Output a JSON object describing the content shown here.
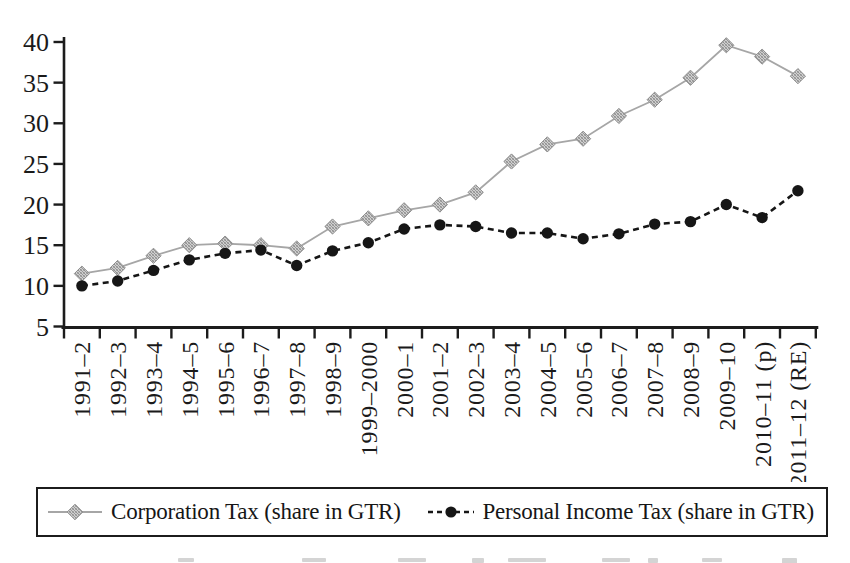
{
  "chart_data": {
    "type": "line",
    "title": "",
    "xlabel": "",
    "ylabel": "",
    "grid": false,
    "legend_position": "bottom",
    "ylim": [
      5,
      40
    ],
    "yticks": [
      5,
      10,
      15,
      20,
      25,
      30,
      35,
      40
    ],
    "categories": [
      "1991–2",
      "1992–3",
      "1993–4",
      "1994–5",
      "1995–6",
      "1996–7",
      "1997–8",
      "1998–9",
      "1999–2000",
      "2000–1",
      "2001–2",
      "2002–3",
      "2003–4",
      "2004–5",
      "2005–6",
      "2006–7",
      "2007–8",
      "2008–9",
      "2009–10",
      "2010–11 (p)",
      "2011–12 (RE)"
    ],
    "series": [
      {
        "name": "Corporation Tax (share in GTR)",
        "marker": "diamond",
        "line_style": "solid",
        "line_color": "#a6a6a6",
        "marker_fill": "#c4c4c4",
        "marker_stroke": "#8f8f8f",
        "values": [
          11.5,
          12.2,
          13.7,
          15.0,
          15.2,
          15.0,
          14.6,
          17.3,
          18.3,
          19.3,
          20.0,
          21.5,
          25.3,
          27.4,
          28.1,
          30.9,
          32.9,
          35.6,
          39.6,
          38.2,
          35.8
        ]
      },
      {
        "name": "Personal Income Tax (share in GTR)",
        "marker": "circle",
        "line_style": "dashed",
        "line_color": "#161616",
        "marker_fill": "#161616",
        "marker_stroke": "#161616",
        "values": [
          10.0,
          10.6,
          11.9,
          13.2,
          14.0,
          14.4,
          12.5,
          14.3,
          15.3,
          17.0,
          17.5,
          17.3,
          16.5,
          16.5,
          15.8,
          16.4,
          17.6,
          17.9,
          20.0,
          18.4,
          21.7
        ]
      }
    ],
    "axis_color": "#1c1c1c",
    "text_color": "#1a1a1a"
  }
}
